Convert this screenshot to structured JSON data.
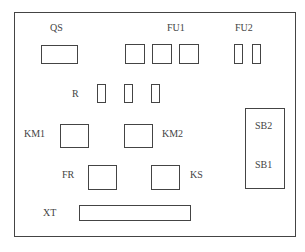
{
  "diagram": {
    "labels": {
      "qs": "QS",
      "fu1": "FU1",
      "fu2": "FU2",
      "r": "R",
      "km1": "KM1",
      "km2": "KM2",
      "fr": "FR",
      "ks": "KS",
      "sb2": "SB2",
      "sb1": "SB1",
      "xt": "XT"
    },
    "components": [
      {
        "id": "QS",
        "count": 1
      },
      {
        "id": "FU1",
        "count": 3
      },
      {
        "id": "FU2",
        "count": 2
      },
      {
        "id": "R",
        "count": 3
      },
      {
        "id": "KM1",
        "count": 1
      },
      {
        "id": "KM2",
        "count": 1
      },
      {
        "id": "FR",
        "count": 1
      },
      {
        "id": "KS",
        "count": 1
      },
      {
        "id": "SB1/SB2",
        "count": 1
      },
      {
        "id": "XT",
        "count": 1
      }
    ]
  }
}
